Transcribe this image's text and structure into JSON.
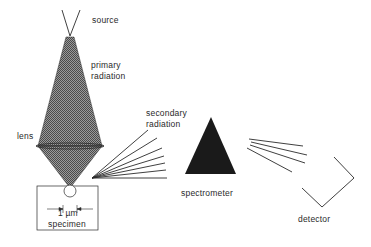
{
  "labels": {
    "source": "source",
    "primary_radiation_line1": "primary",
    "primary_radiation_line2": "radiation",
    "lens": "lens",
    "secondary_radiation_line1": "secondary",
    "secondary_radiation_line2": "radiation",
    "spectrometer": "spectrometer",
    "detector": "detector",
    "scale": "1 µm",
    "specimen": "specimen"
  },
  "colors": {
    "ink": "#2a2a2a",
    "fill_dark": "#1a1a1a",
    "hatch": "#777777",
    "background": "#ffffff"
  }
}
